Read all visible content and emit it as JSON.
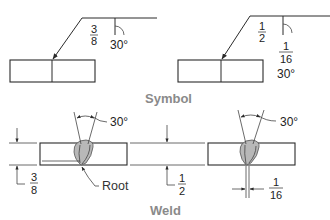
{
  "figure": {
    "sections": {
      "symbol": {
        "caption": "Symbol",
        "left": {
          "groove_depth": {
            "numerator": "3",
            "denominator": "8"
          },
          "groove_angle": "30°"
        },
        "right": {
          "groove_depth": {
            "numerator": "1",
            "denominator": "2"
          },
          "root_opening": {
            "numerator": "1",
            "denominator": "16"
          },
          "groove_angle": "30°"
        }
      },
      "weld": {
        "caption": "Weld",
        "left": {
          "groove_angle": "30°",
          "thickness": {
            "numerator": "3",
            "denominator": "8"
          },
          "root_label": "Root"
        },
        "middle": {
          "thickness": {
            "numerator": "1",
            "denominator": "2"
          }
        },
        "right": {
          "groove_angle": "30°",
          "root_opening": {
            "numerator": "1",
            "denominator": "16"
          }
        }
      }
    },
    "colors": {
      "line": "#2a2a2a",
      "bead_fill": "#b8b8b8",
      "caption": "#8a8a8a"
    }
  }
}
